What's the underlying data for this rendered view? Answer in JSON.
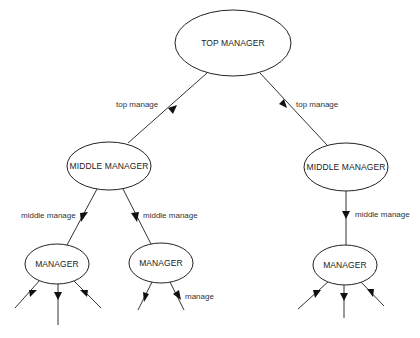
{
  "diagram": {
    "type": "org-hierarchy",
    "nodes": [
      {
        "id": "top",
        "label": "TOP MANAGER",
        "cx": 233,
        "cy": 43,
        "rx": 58,
        "ry": 33
      },
      {
        "id": "mid_left",
        "label": "MIDDLE MANAGER",
        "cx": 109,
        "cy": 166,
        "rx": 42,
        "ry": 24
      },
      {
        "id": "mid_right",
        "label": "MIDDLE MANAGER",
        "cx": 346,
        "cy": 167,
        "rx": 42,
        "ry": 24
      },
      {
        "id": "mgr_left",
        "label": "MANAGER",
        "cx": 57,
        "cy": 264,
        "rx": 32,
        "ry": 20
      },
      {
        "id": "mgr_center",
        "label": "MANAGER",
        "cx": 161,
        "cy": 263,
        "rx": 32,
        "ry": 20
      },
      {
        "id": "mgr_right",
        "label": "MANAGER",
        "cx": 345,
        "cy": 265,
        "rx": 32,
        "ry": 20
      }
    ],
    "edges": [
      {
        "from": "top",
        "to": "mid_left",
        "label": "top manage"
      },
      {
        "from": "top",
        "to": "mid_right",
        "label": "top manage"
      },
      {
        "from": "mid_left",
        "to": "mgr_left",
        "label": "middle manage"
      },
      {
        "from": "mid_left",
        "to": "mgr_center",
        "label": "middle manage"
      },
      {
        "from": "mid_right",
        "to": "mgr_right",
        "label": "middle manage"
      },
      {
        "from": "mgr_center",
        "to": "(unlabeled)",
        "label": "manage"
      }
    ]
  }
}
